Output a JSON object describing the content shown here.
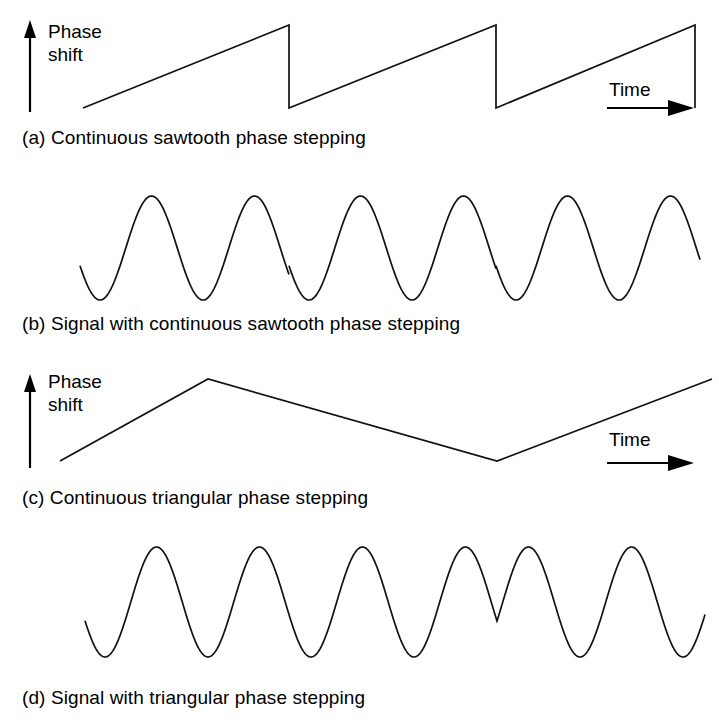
{
  "figure": {
    "type": "phase-stepping-waveform-figure",
    "background_color": "#ffffff",
    "stroke_color": "#111111"
  },
  "axes": {
    "vertical_label_line1": "Phase",
    "vertical_label_line2": "shift",
    "time_label": "Time"
  },
  "panels": [
    {
      "id": "a",
      "caption": "(a) Continuous sawtooth phase stepping",
      "has_axes": true,
      "wave_type": "sawtooth"
    },
    {
      "id": "b",
      "caption": "(b) Signal with continuous sawtooth phase stepping",
      "has_axes": false,
      "wave_type": "sine-with-sawtooth-phase"
    },
    {
      "id": "c",
      "caption": "(c) Continuous triangular phase stepping",
      "has_axes": true,
      "wave_type": "triangular"
    },
    {
      "id": "d",
      "caption": "(d) Signal with triangular phase stepping",
      "has_axes": false,
      "wave_type": "sine-with-triangular-phase"
    }
  ],
  "chart_data": {
    "type": "line",
    "xlabel": "Time",
    "ylabel": "Phase shift",
    "grid": false,
    "legend": "none",
    "panels": [
      {
        "id": "a",
        "title": "(a) Continuous sawtooth phase stepping",
        "waveform": "sawtooth",
        "description": "Linear phase ramp resetting abruptly each period",
        "x_range": [
          83,
          695
        ],
        "y_range_px": [
          25,
          108
        ],
        "ramp_start_x": 83,
        "period_px": 207,
        "reset_x": [
          289,
          496,
          695
        ],
        "ramp_low_y": 108,
        "ramp_high_y": 25,
        "cycles": 3,
        "vertices": [
          [
            83,
            108
          ],
          [
            289,
            25
          ],
          [
            289,
            108
          ],
          [
            496,
            25
          ],
          [
            496,
            108
          ],
          [
            695,
            25
          ],
          [
            695,
            108
          ]
        ]
      },
      {
        "id": "b",
        "title": "(b) Signal with continuous sawtooth phase stepping",
        "waveform": "sine",
        "description": "Sinusoid whose phase jumps at each sawtooth reset",
        "x_range": [
          80,
          700
        ],
        "baseline_y": 248,
        "amplitude_px": 52,
        "peak_y": 197,
        "trough_y": 300,
        "sine_period_px": 103,
        "phase_jump_x": [
          289,
          496
        ],
        "visible_peaks": 6,
        "start_phase_deg": 200
      },
      {
        "id": "c",
        "title": "(c) Continuous triangular phase stepping",
        "waveform": "triangular",
        "description": "Phase ramps up then down symmetrically",
        "x_range": [
          60,
          712
        ],
        "y_range_px": [
          379,
          461
        ],
        "start_point": [
          60,
          461
        ],
        "peak_point": [
          208,
          379
        ],
        "valley_point": [
          497,
          461
        ],
        "end_point": [
          712,
          379
        ],
        "cycles": 1
      },
      {
        "id": "d",
        "title": "(d) Signal with triangular phase stepping",
        "waveform": "sine",
        "description": "Sinusoid mirrored in time at each triangle apex, giving a notched double peak at the phase maximum and a notched double trough at the phase minimum",
        "x_range": [
          85,
          705
        ],
        "baseline_y": 602,
        "amplitude_px": 55,
        "peak_y": 548,
        "trough_y": 658,
        "sine_period_px": 103,
        "mirror_x": [
          208,
          497
        ],
        "notch_peak_x": 208,
        "notch_trough_x": 497
      }
    ]
  }
}
